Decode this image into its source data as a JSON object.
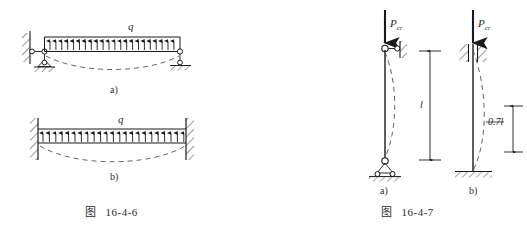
{
  "sheet": {
    "width": 527,
    "height": 236,
    "background": "#ffffff",
    "ink_color": "#1a1a1a",
    "dash_color": "#555555"
  },
  "figures": [
    {
      "id": "fig-16-4-6",
      "caption_prefix": "图",
      "caption_number": "16-4-6",
      "subject": "buckling of beams under uniformly distributed load q",
      "parts": [
        {
          "key": "a",
          "label": "a)",
          "load_symbol": "q",
          "load_direction": "upward",
          "arrow_count": 23,
          "left_support": "link-to-wall-with-pin-below",
          "right_support": "pin-on-roller",
          "deflection": "dashed-sag-curve"
        },
        {
          "key": "b",
          "label": "b)",
          "load_symbol": "q",
          "load_direction": "upward",
          "arrow_count": 23,
          "left_support": "fixed-hatched-wall",
          "right_support": "fixed-hatched-wall",
          "deflection": "dashed-sag-curve"
        }
      ]
    },
    {
      "id": "fig-16-4-7",
      "caption_prefix": "图",
      "caption_number": "16-4-7",
      "subject": "critical buckling load of columns with different end conditions",
      "parts": [
        {
          "key": "a",
          "label": "a)",
          "load_symbol": "P",
          "load_subscript": "cr",
          "load_direction": "downward",
          "top_support": "pin-with-horizontal-link-to-wall",
          "bottom_support": "pin-on-rollers",
          "effective_length_label": "l",
          "deflection": "dashed-buckled-curve"
        },
        {
          "key": "b",
          "label": "b)",
          "load_symbol": "P",
          "load_subscript": "cr",
          "load_direction": "downward",
          "top_support": "guided-sliding-hatched",
          "bottom_support": "fixed-base-hatched",
          "effective_length_label": "0.7l",
          "deflection": "dashed-buckled-curve"
        }
      ]
    }
  ]
}
